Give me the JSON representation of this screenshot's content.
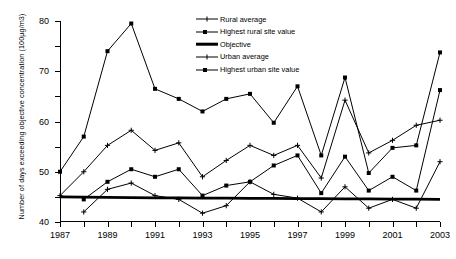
{
  "chart_data": {
    "type": "line",
    "title": "",
    "xlabel": "",
    "ylabel": "Number of days exceeding objective concentration (100µg/m3)",
    "xlim": [
      1987,
      2003
    ],
    "ylim": [
      0,
      80
    ],
    "ytick_labels": [
      "0",
      "10",
      "20",
      "30",
      "40",
      "50",
      "60",
      "70",
      "80"
    ],
    "ytick_values": [
      0,
      10,
      20,
      30,
      40,
      50,
      60,
      70,
      80
    ],
    "xtick_values": [
      1987,
      1988,
      1989,
      1990,
      1991,
      1992,
      1993,
      1994,
      1995,
      1996,
      1997,
      1998,
      1999,
      2000,
      2001,
      2002,
      2003
    ],
    "xtick_labels": [
      "1987",
      "",
      "1989",
      "",
      "1991",
      "",
      "1993",
      "",
      "1995",
      "",
      "1997",
      "",
      "1999",
      "",
      "2001",
      "",
      "2003"
    ],
    "x": [
      1987,
      1988,
      1989,
      1990,
      1991,
      1992,
      1993,
      1994,
      1995,
      1996,
      1997,
      1998,
      1999,
      2000,
      2001,
      2002,
      2003
    ],
    "grid": false,
    "legend_position": "top-center",
    "series": [
      {
        "name": "Rural average",
        "marker": "cross",
        "values": [
          null,
          4,
          13,
          15.5,
          10.5,
          9,
          3.5,
          6.5,
          16,
          11,
          9.5,
          4,
          14,
          5.5,
          9,
          5.5,
          24
        ]
      },
      {
        "name": "Highest rural site value",
        "marker": "square",
        "values": [
          null,
          9,
          16,
          21,
          18,
          21,
          10.5,
          14.5,
          16,
          22.5,
          26.5,
          11.5,
          26,
          12.5,
          18,
          12.5,
          52.5
        ]
      },
      {
        "name": "Objective",
        "marker": "none",
        "values": [
          10,
          9.9,
          9.8,
          9.7,
          9.6,
          9.6,
          9.5,
          9.5,
          9.4,
          9.4,
          9.3,
          9.3,
          9.2,
          9.2,
          9.1,
          9.1,
          9
        ]
      },
      {
        "name": "Urban average",
        "marker": "cross",
        "values": [
          10.5,
          20,
          30.5,
          36.5,
          28.5,
          31.5,
          18,
          24.5,
          30.5,
          26.5,
          30.5,
          17.5,
          48.5,
          27.5,
          32.5,
          38.5,
          40.5
        ]
      },
      {
        "name": "Highest urban site value",
        "marker": "square",
        "values": [
          20,
          34,
          68,
          79,
          53,
          49,
          44,
          49,
          51,
          39.5,
          54,
          26.5,
          57.5,
          19.5,
          29.5,
          30.5,
          67.5
        ]
      }
    ]
  },
  "legend": {
    "items": [
      {
        "label": "Rural average"
      },
      {
        "label": "Highest rural site value"
      },
      {
        "label": "Objective"
      },
      {
        "label": "Urban average"
      },
      {
        "label": "Highest urban site value"
      }
    ]
  }
}
